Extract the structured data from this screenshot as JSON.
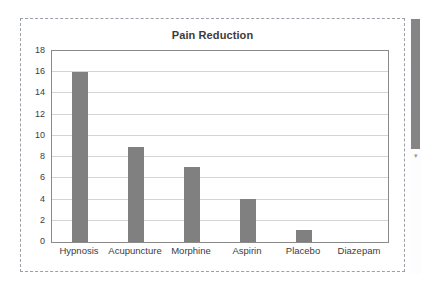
{
  "chart_data": {
    "type": "bar",
    "title": "Pain Reduction",
    "xlabel": "",
    "ylabel": "",
    "categories": [
      "Hypnosis",
      "Acupuncture",
      "Morphine",
      "Aspirin",
      "Placebo",
      "Diazepam"
    ],
    "values": [
      16,
      9,
      7.1,
      4.1,
      1.1,
      0
    ],
    "ylim": [
      0,
      18
    ],
    "ytick_labels": [
      "18",
      "16",
      "14",
      "12",
      "10",
      "8",
      "6",
      "4",
      "2",
      "0"
    ],
    "ytick_values": [
      18,
      16,
      14,
      12,
      10,
      8,
      6,
      4,
      2,
      0
    ],
    "ytick_step": 2,
    "grid": true,
    "grid_axis": "y",
    "legend": false,
    "legend_position": "none",
    "bar_color": "#808080",
    "plot_border_color": "#8a8a8a",
    "gridline_color": "#d4d4d4",
    "title_color": "#3c3c3c",
    "tick_label_color": "#3c3c3c",
    "background_color": "#ffffff"
  },
  "selection": {
    "border_style": "dashed",
    "border_color": "#9aa0a6"
  },
  "scrollbar": {
    "orientation": "vertical",
    "thumb_color": "#858585",
    "track_color": "#fdfdfd",
    "down_arrow_glyph": "▾"
  }
}
